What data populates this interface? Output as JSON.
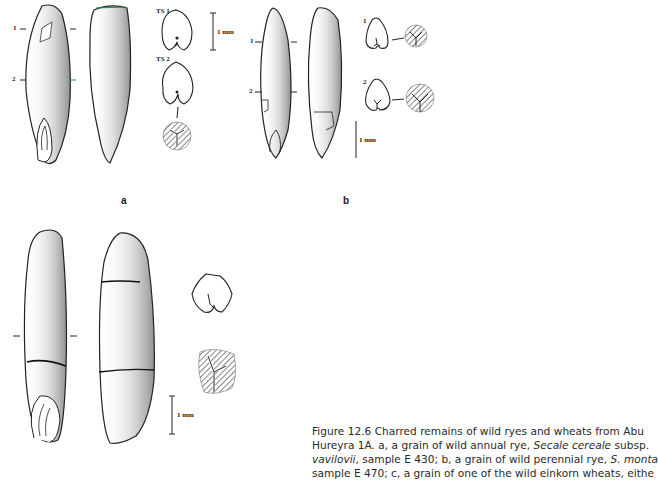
{
  "figure": {
    "panels": [
      {
        "label": "a",
        "section_marks": [
          "1",
          "2"
        ],
        "transverse_sections": [
          "TS 1",
          "TS 2"
        ],
        "scale_bar": "1 mm"
      },
      {
        "label": "b",
        "section_marks": [
          "1",
          "2"
        ],
        "transverse_sections": [
          "1",
          "2"
        ],
        "scale_bar": "1 mm"
      },
      {
        "label": "c",
        "scale_bar": "1 mm"
      }
    ],
    "caption": {
      "line1": "Figure 12.6  Charred remains of wild ryes and wheats from Abu",
      "line2_pre": "Hureyra 1A. a, a grain of wild annual rye, ",
      "line2_italic": "Secale cereale",
      "line2_post": " subsp.",
      "line3_italic": "vavilovii",
      "line3_mid": ", sample E 430; b, a grain of wild perennial rye, ",
      "line3_italic2": "S. monta",
      "line4": "sample E 470; c, a grain of one of the wild einkorn wheats, eithe"
    }
  }
}
